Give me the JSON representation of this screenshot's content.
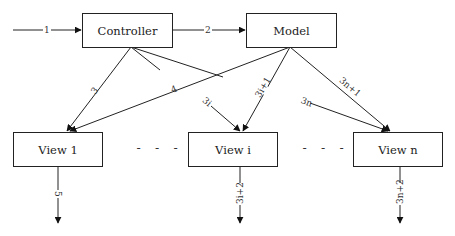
{
  "nodes": {
    "controller": "Controller",
    "model": "Model",
    "view1": "View 1",
    "viewi": "View i",
    "viewn": "View n"
  },
  "ellipsis": [
    "- - -",
    "- - -"
  ],
  "edges": {
    "e1": "1",
    "e2": "2",
    "e3": "3",
    "e4": "4",
    "e3i": "3i",
    "e3i1": "3i+1",
    "e3n": "3n",
    "e3n1": "3n+1",
    "e5": "5",
    "e3i2": "3i+2",
    "e3n2": "3n+2"
  },
  "colors": {
    "line": "#222222",
    "background": "#ffffff"
  }
}
